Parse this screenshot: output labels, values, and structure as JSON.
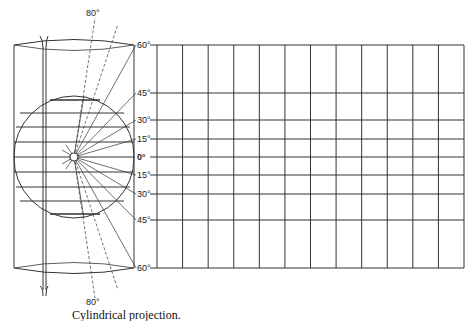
{
  "caption": "Cylindrical projection.",
  "top_angle_label": "80°",
  "bottom_angle_label": "80°",
  "latitude_labels": [
    {
      "label": "60°",
      "y": 45
    },
    {
      "label": "45°",
      "y": 93
    },
    {
      "label": "30°",
      "y": 120
    },
    {
      "label": "15°",
      "y": 139
    },
    {
      "label": "0°",
      "y": 157
    },
    {
      "label": "15°",
      "y": 175
    },
    {
      "label": "30°",
      "y": 194
    },
    {
      "label": "45°",
      "y": 220
    },
    {
      "label": "60°",
      "y": 268
    }
  ],
  "grid": {
    "columns": 12,
    "x_start": 157,
    "x_end": 464,
    "y_top": 45,
    "y_bottom": 268
  },
  "colors": {
    "line": "#333333",
    "background": "#ffffff"
  }
}
